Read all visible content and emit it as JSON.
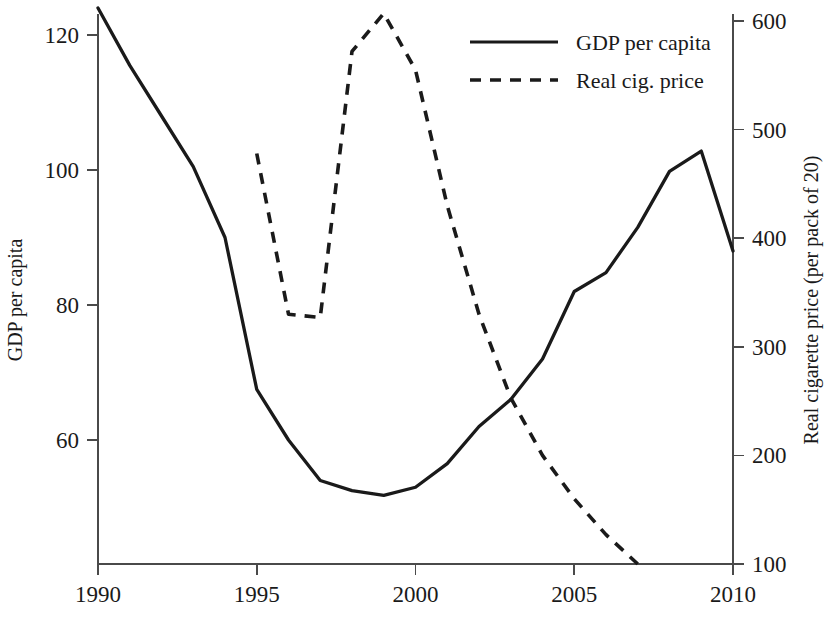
{
  "chart_data": {
    "type": "line",
    "title": "",
    "xlabel": "",
    "ylabel": "GDP per capita",
    "y2label": "Real cigarette price (per pack of 20)",
    "xlim": [
      1990,
      2010
    ],
    "ylim": [
      51,
      124
    ],
    "y2lim": [
      96,
      612
    ],
    "grid": false,
    "legend_position": "top-center",
    "x_ticks": [
      1990,
      1995,
      2000,
      2005,
      2010
    ],
    "x_tick_labels": [
      "1990",
      "1995",
      "2000",
      "2005",
      "2010"
    ],
    "y_ticks": [
      60,
      80,
      100,
      120
    ],
    "y_tick_labels": [
      "60",
      "80",
      "100",
      "120"
    ],
    "y2_ticks": [
      100,
      200,
      300,
      400,
      500,
      600
    ],
    "y2_tick_labels": [
      "100",
      "200",
      "300",
      "400",
      "500",
      "600"
    ],
    "series": [
      {
        "name": "GDP per capita",
        "axis": "left",
        "style": "solid",
        "color": "#1a1a1a",
        "x": [
          1990,
          1991,
          1992,
          1993,
          1994,
          1995,
          1996,
          1997,
          1998,
          1999,
          2000,
          2001,
          2002,
          2003,
          2004,
          2005,
          2006,
          2007,
          2008,
          2009,
          2010
        ],
        "values": [
          124.0,
          115.5,
          108.0,
          100.5,
          90.0,
          67.5,
          60.0,
          54.0,
          52.5,
          51.8,
          53.0,
          56.5,
          62.0,
          66.0,
          72.0,
          82.0,
          84.8,
          91.5,
          99.8,
          102.8,
          88.0
        ]
      },
      {
        "name": "Real cig. price",
        "axis": "right",
        "style": "dashed",
        "color": "#1a1a1a",
        "x": [
          1995,
          1996,
          1997,
          1998,
          1999,
          2000,
          2001,
          2002,
          2003,
          2004,
          2005,
          2006,
          2007
        ],
        "values": [
          478,
          330,
          327,
          572,
          607,
          555,
          430,
          330,
          253,
          200,
          160,
          127,
          100
        ]
      }
    ]
  },
  "legend": {
    "items": [
      {
        "label": "GDP per capita",
        "style": "solid"
      },
      {
        "label": "Real cig. price",
        "style": "dashed"
      }
    ]
  },
  "axes": {
    "left_title": "GDP per capita",
    "right_title": "Real cigarette price (per pack of 20)"
  }
}
